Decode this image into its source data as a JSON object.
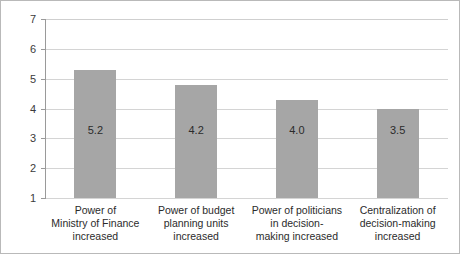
{
  "chart_data": {
    "type": "bar",
    "title": "",
    "xlabel": "",
    "ylabel": "",
    "ylim": [
      1,
      7
    ],
    "yticks": [
      1,
      2,
      3,
      4,
      5,
      6,
      7
    ],
    "grid": true,
    "legend": false,
    "orientation": "vertical",
    "bar_color": "#a6a6a6",
    "categories": [
      "Power of\nMinistry of Finance\nincreased",
      "Power of budget\nplanning units\nincreased",
      "Power of politicians\nin decision-\nmaking increased",
      "Centralization of\ndecision-making\nincreased"
    ],
    "values": [
      5.2,
      4.2,
      4.0,
      3.5
    ],
    "value_labels": [
      "5.2",
      "4.2",
      "4.0",
      "3.5"
    ],
    "drawn_bar_tops": [
      5.3,
      4.8,
      4.3,
      4.0
    ]
  },
  "axis": {
    "y_tick_labels": [
      "7",
      "6",
      "5",
      "4",
      "3",
      "2",
      "1"
    ]
  },
  "colors": {
    "bar_fill": "#a6a6a6",
    "gridline": "#d4d4d4",
    "axis_line": "#9a9a9a",
    "border": "#b9b9b9",
    "text": "#2b2b2b",
    "background": "#ffffff"
  }
}
